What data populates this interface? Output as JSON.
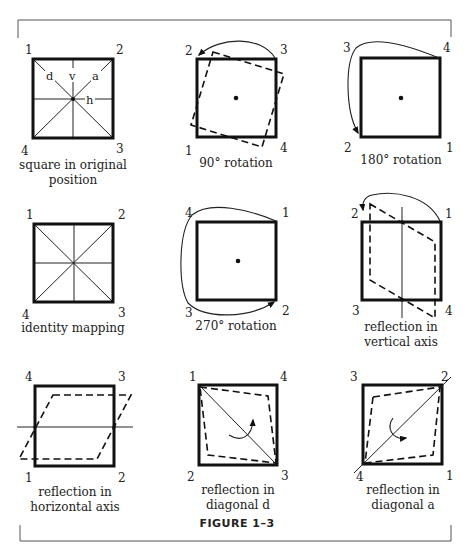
{
  "figure": {
    "title": "FIGURE 1–3",
    "panels": [
      {
        "id": "original",
        "caption": [
          "square in original",
          "position"
        ],
        "corners": {
          "tl": "1",
          "tr": "2",
          "br": "3",
          "bl": "4"
        },
        "axis_labels": {
          "d": "d",
          "v": "v",
          "a": "a",
          "h": "h"
        }
      },
      {
        "id": "rot90",
        "caption": [
          "90° rotation"
        ],
        "corners": {
          "tl": "2",
          "tr": "3",
          "br": "4",
          "bl": "1"
        }
      },
      {
        "id": "rot180",
        "caption": [
          "180° rotation"
        ],
        "corners": {
          "tl": "3",
          "tr": "4",
          "br": "1",
          "bl": "2"
        }
      },
      {
        "id": "identity",
        "caption": [
          "identity mapping"
        ],
        "corners": {
          "tl": "1",
          "tr": "2",
          "br": "3",
          "bl": "4"
        }
      },
      {
        "id": "rot270",
        "caption": [
          "270° rotation"
        ],
        "corners": {
          "tl": "4",
          "tr": "1",
          "br": "2",
          "bl": "3"
        }
      },
      {
        "id": "refl-vertical",
        "caption": [
          "reflection in",
          "vertical axis"
        ],
        "corners": {
          "tl": "2",
          "tr": "1",
          "br": "4",
          "bl": "3"
        }
      },
      {
        "id": "refl-horizontal",
        "caption": [
          "reflection in",
          "horizontal axis"
        ],
        "corners": {
          "tl": "4",
          "tr": "3",
          "br": "2",
          "bl": "1"
        }
      },
      {
        "id": "refl-diag-d",
        "caption": [
          "reflection in",
          "diagonal d"
        ],
        "corners": {
          "tl": "1",
          "tr": "4",
          "br": "3",
          "bl": "2"
        }
      },
      {
        "id": "refl-diag-a",
        "caption": [
          "reflection in",
          "diagonal a"
        ],
        "corners": {
          "tl": "3",
          "tr": "2",
          "br": "1",
          "bl": "4"
        }
      }
    ]
  }
}
